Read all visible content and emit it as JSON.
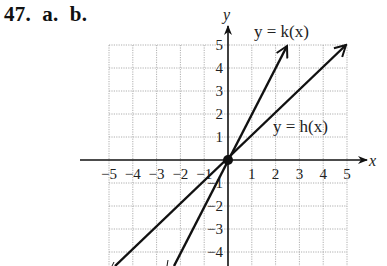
{
  "problem": {
    "number": "47.",
    "parts": [
      "a.",
      "b."
    ],
    "label": "47.  a.  b."
  },
  "axes": {
    "x_label": "x",
    "y_label": "y"
  },
  "functions": {
    "k_label": "y = k(x)",
    "h_label": "y = h(x)"
  },
  "chart_data": {
    "type": "line",
    "title": "",
    "xlabel": "x",
    "ylabel": "y",
    "xlim": [
      -5,
      5
    ],
    "ylim": [
      -4.6,
      5
    ],
    "grid": true,
    "x_ticks": [
      "-5",
      "-4",
      "-3",
      "-2",
      "-1",
      "1",
      "2",
      "3",
      "4",
      "5"
    ],
    "y_ticks": [
      "5",
      "4",
      "3",
      "2",
      "1",
      "-1",
      "-2",
      "-3",
      "-4"
    ],
    "series": [
      {
        "name": "y = k(x)",
        "x": [
          -2.3,
          0,
          2.5
        ],
        "y": [
          -4.6,
          0,
          5
        ],
        "arrow_end": true
      },
      {
        "name": "y = h(x)",
        "x": [
          -4.6,
          0,
          5
        ],
        "y": [
          -4.6,
          0,
          5
        ],
        "arrow_end": true
      }
    ],
    "points": [
      {
        "x": 0,
        "y": 0,
        "label": "origin (intersection)"
      }
    ],
    "annotations": [
      {
        "text": "y = k(x)",
        "x": 1.5,
        "y": 5.5
      },
      {
        "text": "y = h(x)",
        "x": 3.3,
        "y": 1.3
      }
    ]
  },
  "tick_labels": {
    "x": [
      "−5",
      "−4",
      "−3",
      "−2",
      "−1",
      "1",
      "2",
      "3",
      "4",
      "5"
    ],
    "y": [
      "5",
      "4",
      "3",
      "2",
      "1",
      "−1",
      "−2",
      "−3",
      "−4"
    ]
  }
}
